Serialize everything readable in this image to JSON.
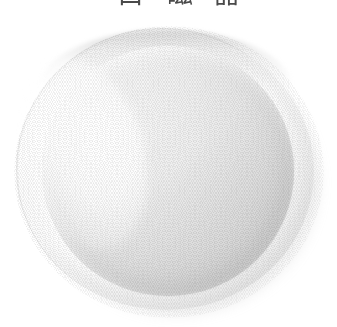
{
  "page": {
    "background_color": "#ffffff",
    "width": 337,
    "height": 327,
    "media": "scanned printed catalog page"
  },
  "caption": {
    "note": "Three CJK characters along the very top edge, clipped by the page crop so only the lowest few pixels of each glyph are visible.",
    "clipped": true,
    "text_color": "#4a4a4a",
    "glyphs": [
      {
        "char": "白",
        "label": "caption-glyph-1"
      },
      {
        "char": "磁",
        "label": "caption-glyph-2"
      },
      {
        "char": "器",
        "label": "caption-glyph-3"
      }
    ]
  },
  "photo": {
    "subject": "white ceramic plate",
    "view": "slightly tilted overhead / three-quarter top view",
    "shape": "round, rendered as a near-circular ellipse",
    "light_direction": "upper-left",
    "colors": {
      "paper_white": "#ffffff",
      "rim_highlight": "#ffffff",
      "rim_band": "#f4f4f4",
      "well_light": "#f3f3f3",
      "well_mid": "#dedede",
      "well_dark": "#c6c6c6",
      "outer_contour_line": "#e9e9e9",
      "top_rim_arc": "#b0b0b0"
    },
    "parts": [
      {
        "name": "outer-contour",
        "description": "faint thin outline tracing the outer edge of the rim, clearest along the left and upper-left"
      },
      {
        "name": "rim",
        "description": "bright flat lip of the plate, nearly pure white on the upper-left"
      },
      {
        "name": "rim-top-arc",
        "description": "darker grey arc along the top of the rim where it turns away from the light"
      },
      {
        "name": "well",
        "description": "recessed inner surface, shaded progressively darker toward the lower-right"
      },
      {
        "name": "cast-shadow",
        "description": "soft grey contact shadow beneath the lower-right of the plate"
      },
      {
        "name": "halftone",
        "description": "visible crosshatch halftone dot screen from the printing process"
      }
    ]
  }
}
